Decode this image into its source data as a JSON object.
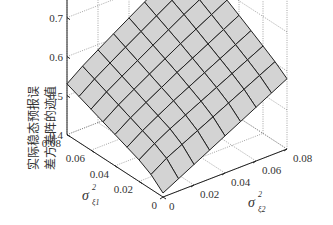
{
  "chart_data": {
    "type": "surface3d",
    "title": "",
    "zlabel_line1": "实际稳态预报误",
    "zlabel_line2": "差方差阵的迹值",
    "xlabel": "σ²ξ1",
    "ylabel": "σ²ξ2",
    "x_name": "sigma_xi1_squared",
    "y_name": "sigma_xi2_squared",
    "x_ticks": [
      "0",
      "0.02",
      "0.04",
      "0.06",
      "0.08"
    ],
    "y_ticks": [
      "0",
      "0.02",
      "0.04",
      "0.06",
      "0.08"
    ],
    "z_ticks": [
      "0.4",
      "0.5",
      "0.6",
      "0.7",
      "0.8"
    ],
    "xlim": [
      0,
      0.08
    ],
    "ylim": [
      0,
      0.08
    ],
    "zlim": [
      0.4,
      0.8
    ],
    "grid": true,
    "surface_color": "#d3d3d3",
    "edge_color": "#222222",
    "grid_x": [
      0,
      0.01,
      0.02,
      0.03,
      0.04,
      0.05,
      0.06,
      0.07,
      0.08
    ],
    "grid_y": [
      0,
      0.01,
      0.02,
      0.03,
      0.04,
      0.05,
      0.06,
      0.07,
      0.08
    ],
    "corner_values": {
      "x0_y0": 0.43,
      "x0.08_y0": 0.53,
      "x0_y0.08": 0.58,
      "x0.08_y0.08": 0.72
    }
  }
}
